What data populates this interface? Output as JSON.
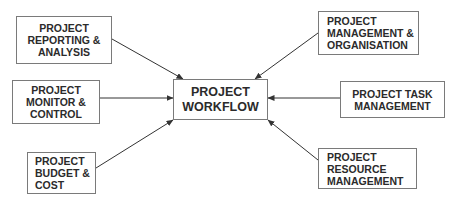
{
  "diagram": {
    "center": {
      "lines": [
        "PROJECT",
        "WORKFLOW"
      ]
    },
    "nodes": [
      {
        "id": "reporting",
        "lines": [
          "PROJECT",
          "REPORTING &",
          "ANALYSIS"
        ]
      },
      {
        "id": "monitor",
        "lines": [
          "PROJECT",
          "MONITOR &",
          "CONTROL"
        ]
      },
      {
        "id": "budget",
        "lines": [
          "PROJECT",
          "BUDGET &",
          "COST"
        ]
      },
      {
        "id": "management",
        "lines": [
          "PROJECT",
          "MANAGEMENT &",
          "ORGANISATION"
        ]
      },
      {
        "id": "task",
        "lines": [
          "PROJECT TASK",
          "MANAGEMENT"
        ]
      },
      {
        "id": "resource",
        "lines": [
          "PROJECT",
          "RESOURCE",
          "MANAGEMENT"
        ]
      }
    ],
    "edges": [
      {
        "from": "reporting",
        "to": "center"
      },
      {
        "from": "monitor",
        "to": "center"
      },
      {
        "from": "budget",
        "to": "center"
      },
      {
        "from": "management",
        "to": "center"
      },
      {
        "from": "task",
        "to": "center"
      },
      {
        "from": "resource",
        "to": "center"
      }
    ],
    "colors": {
      "border": "#7a7a7a",
      "text": "#2b2b2b",
      "arrow": "#333333",
      "background": "#ffffff"
    }
  }
}
